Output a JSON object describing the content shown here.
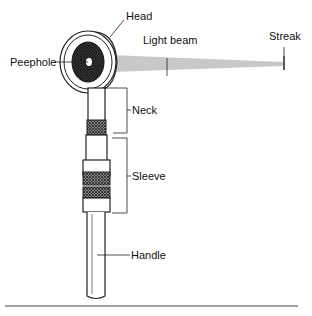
{
  "diagram": {
    "labels": {
      "head": "Head",
      "light_beam": "Light beam",
      "streak": "Streak",
      "peephole": "Peephole",
      "neck": "Neck",
      "sleeve": "Sleeve",
      "handle": "Handle"
    },
    "colors": {
      "stroke": "#222222",
      "beam": "#c8c8c8",
      "knurl": "#555555"
    }
  }
}
